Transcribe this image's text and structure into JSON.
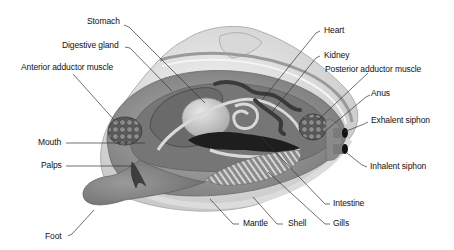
{
  "diagram": {
    "colors": {
      "background": "#ffffff",
      "leader_line": "#333333",
      "label_text": "#111111",
      "shell_light": "#e6e6e6",
      "shell_mid": "#bdbdbd",
      "body_mid": "#8f8f8f",
      "organ_dark": "#4a4a4a",
      "organ_darkest": "#1e1e1e"
    },
    "labels": {
      "stomach": "Stomach",
      "digestive_gland": "Digestive gland",
      "anterior_adductor": "Anterior adductor muscle",
      "mouth": "Mouth",
      "palps": "Palps",
      "foot": "Foot",
      "heart": "Heart",
      "kidney": "Kidney",
      "posterior_adductor": "Posterior adductor muscle",
      "anus": "Anus",
      "exhalent_siphon": "Exhalent siphon",
      "inhalent_siphon": "Inhalent siphon",
      "intestine": "Intestine",
      "gills": "Gills",
      "shell": "Shell",
      "mantle": "Mantle"
    }
  }
}
